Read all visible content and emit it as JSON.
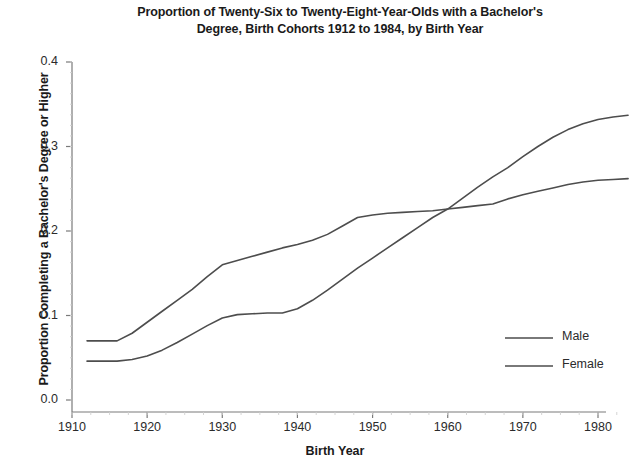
{
  "chart_data": {
    "type": "line",
    "title": "Proportion of Twenty-Six to Twenty-Eight-Year-Olds with a Bachelor's Degree, Birth Cohorts 1912 to 1984, by Birth Year",
    "title_lines": [
      "Proportion of Twenty-Six to Twenty-Eight-Year-Olds with a Bachelor's",
      "Degree, Birth Cohorts 1912 to 1984, by Birth Year"
    ],
    "xlabel": "Birth Year",
    "ylabel": "Proportion Completing a Bachelor's Degree or Higher",
    "xlim": [
      1908,
      1986
    ],
    "ylim": [
      0.0,
      0.4
    ],
    "xticks": [
      1910,
      1920,
      1930,
      1940,
      1950,
      1960,
      1970,
      1980
    ],
    "xtick_labels": [
      "1910",
      "1920",
      "1930",
      "1940",
      "1950",
      "1960",
      "1970",
      "1980"
    ],
    "yticks": [
      0.0,
      0.1,
      0.2,
      0.3,
      0.4
    ],
    "ytick_labels": [
      "0.0",
      "0.1",
      "0.2",
      "0.3",
      "0.4"
    ],
    "grid": false,
    "legend_position": "bottom-right",
    "line_color": "#4d4d4d",
    "axis_color": "#7a7a7a",
    "series": [
      {
        "name": "Male",
        "x": [
          1912,
          1914,
          1916,
          1918,
          1920,
          1922,
          1924,
          1926,
          1928,
          1930,
          1932,
          1934,
          1936,
          1938,
          1940,
          1942,
          1944,
          1946,
          1948,
          1950,
          1952,
          1954,
          1956,
          1958,
          1960,
          1962,
          1964,
          1966,
          1968,
          1970,
          1972,
          1974,
          1976,
          1978,
          1980,
          1982,
          1984
        ],
        "values": [
          0.07,
          0.07,
          0.07,
          0.079,
          0.092,
          0.105,
          0.118,
          0.131,
          0.146,
          0.16,
          0.165,
          0.17,
          0.175,
          0.18,
          0.184,
          0.189,
          0.196,
          0.206,
          0.216,
          0.219,
          0.221,
          0.222,
          0.223,
          0.224,
          0.226,
          0.228,
          0.23,
          0.232,
          0.238,
          0.243,
          0.247,
          0.251,
          0.255,
          0.258,
          0.26,
          0.261,
          0.262
        ]
      },
      {
        "name": "Female",
        "x": [
          1912,
          1914,
          1916,
          1918,
          1920,
          1922,
          1924,
          1926,
          1928,
          1930,
          1932,
          1934,
          1936,
          1938,
          1940,
          1942,
          1944,
          1946,
          1948,
          1950,
          1952,
          1954,
          1956,
          1958,
          1960,
          1962,
          1964,
          1966,
          1968,
          1970,
          1972,
          1974,
          1976,
          1978,
          1980,
          1982,
          1984
        ],
        "values": [
          0.046,
          0.046,
          0.046,
          0.048,
          0.052,
          0.059,
          0.068,
          0.078,
          0.088,
          0.097,
          0.101,
          0.102,
          0.103,
          0.103,
          0.108,
          0.118,
          0.13,
          0.143,
          0.156,
          0.168,
          0.18,
          0.192,
          0.204,
          0.216,
          0.226,
          0.239,
          0.252,
          0.264,
          0.275,
          0.288,
          0.3,
          0.311,
          0.32,
          0.327,
          0.332,
          0.335,
          0.337
        ]
      }
    ],
    "annotations": {
      "crossover_birth_year": 1961,
      "crossover_value": 0.227
    }
  },
  "legend": {
    "items": [
      {
        "label": "Male"
      },
      {
        "label": "Female"
      }
    ]
  }
}
